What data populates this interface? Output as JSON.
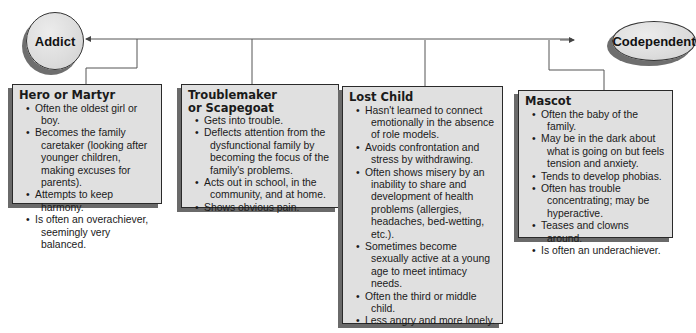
{
  "diagram": {
    "nodes": {
      "addict": "Addict",
      "codependent": "Codependent"
    },
    "colors": {
      "box_fill": "#e0e0e0",
      "box_border": "#2a2a2a",
      "shadow": "#6a6a6a",
      "connector": "#555555"
    },
    "roles": [
      {
        "title": "Hero or Martyr",
        "items": [
          "Often the oldest girl or boy.",
          "Becomes the family caretaker (looking after younger children, making excuses for parents).",
          "Attempts to keep harmony.",
          "Is often an overachiever, seemingly very balanced."
        ]
      },
      {
        "title": "Troublemaker or Scapegoat",
        "items": [
          "Gets into trouble.",
          "Deflects attention from the dysfunctional family by becoming the focus of the family's problems.",
          "Acts out in school, in the community, and at home.",
          "Shows obvious pain."
        ]
      },
      {
        "title": "Lost Child",
        "items": [
          "Hasn't learned to connect emotionally in the absence of role models.",
          "Avoids confrontation and stress by withdrawing.",
          "Often shows misery by an inability to share and development of health problems (allergies, headaches, bed-wetting, etc.).",
          "Sometimes become sexually active at a young age to meet intimacy needs.",
          "Often the third or middle child.",
          "Less angry and more lonely."
        ]
      },
      {
        "title": "Mascot",
        "items": [
          "Often the baby of the family.",
          "May be in the dark about what is going on but feels tension and anxiety.",
          "Tends to develop phobias.",
          "Often has trouble concentrating; may be hyperactive.",
          "Teases and clowns around.",
          "Is often an underachiever."
        ]
      }
    ]
  }
}
